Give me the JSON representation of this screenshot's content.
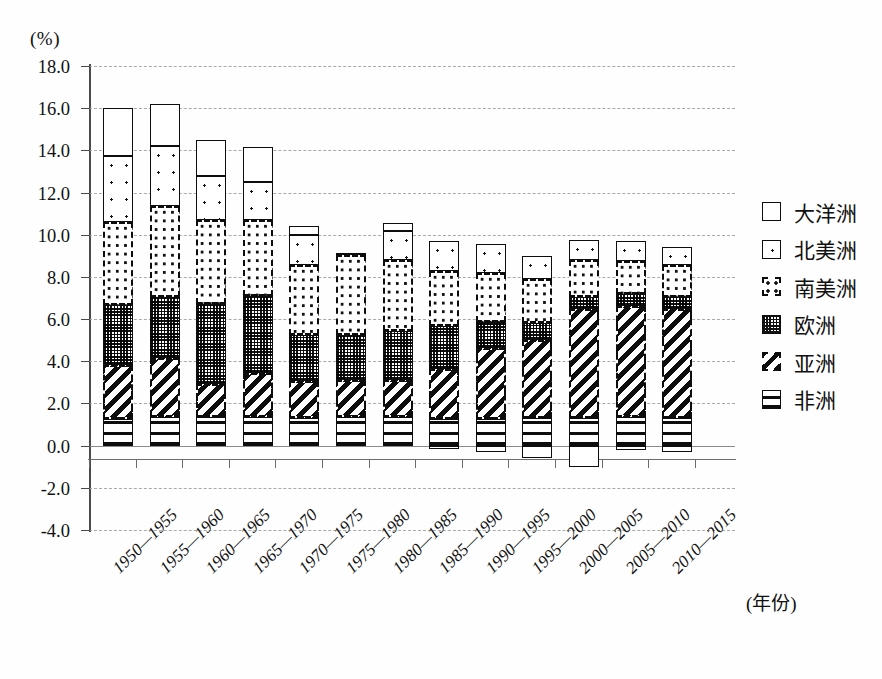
{
  "chart_data": {
    "type": "bar",
    "subtype": "stacked-bar",
    "title": "",
    "unit_label": "(%)",
    "xlabel": "(年份)",
    "ylabel": "",
    "ylim": [
      -4.0,
      18.0
    ],
    "ytick_step": 2.0,
    "ytick_labels": [
      "18.0",
      "16.0",
      "14.0",
      "12.0",
      "10.0",
      "8.0",
      "6.0",
      "4.0",
      "2.0",
      "0.0",
      "-2.0",
      "-4.0"
    ],
    "ytick_values": [
      18.0,
      16.0,
      14.0,
      12.0,
      10.0,
      8.0,
      6.0,
      4.0,
      2.0,
      0.0,
      -2.0,
      -4.0
    ],
    "grid": true,
    "legend_position": "right",
    "categories": [
      "1950—1955",
      "1955—1960",
      "1960—1965",
      "1965—1970",
      "1970—1975",
      "1975—1980",
      "1980—1985",
      "1985—1990",
      "1990—1995",
      "1995—2000",
      "2000—2005",
      "2005—2010",
      "2010—2015"
    ],
    "series": [
      {
        "name": "非洲",
        "key": "africa",
        "swatch": "horizontal-lines",
        "values": [
          1.25,
          1.35,
          1.35,
          1.35,
          1.3,
          1.35,
          1.35,
          1.25,
          1.25,
          1.3,
          1.3,
          1.35,
          1.3
        ]
      },
      {
        "name": "亚洲",
        "key": "asia",
        "swatch": "diagonal-stripes",
        "values": [
          2.55,
          2.8,
          1.55,
          2.1,
          1.75,
          1.75,
          1.75,
          2.4,
          3.4,
          3.7,
          5.2,
          5.25,
          5.2
        ]
      },
      {
        "name": "欧洲",
        "key": "europe",
        "swatch": "checkerboard",
        "values": [
          2.85,
          2.9,
          3.8,
          3.65,
          2.2,
          2.15,
          2.35,
          2.0,
          1.2,
          0.8,
          0.55,
          0.6,
          0.55
        ]
      },
      {
        "name": "南美洲",
        "key": "samerica",
        "swatch": "dense-dots",
        "values": [
          3.95,
          4.3,
          4.0,
          3.6,
          3.3,
          3.8,
          3.35,
          2.65,
          2.35,
          2.1,
          1.75,
          1.55,
          1.5
        ]
      },
      {
        "name": "北美洲",
        "key": "namerica",
        "swatch": "sparse-dot",
        "values": [
          3.15,
          2.85,
          2.1,
          1.8,
          1.45,
          0.0,
          1.4,
          1.4,
          1.35,
          1.1,
          0.95,
          0.95,
          0.85
        ]
      },
      {
        "name": "大洋洲",
        "key": "oceania",
        "swatch": "plain-white",
        "values": [
          2.25,
          2.0,
          1.7,
          1.65,
          0.4,
          0.1,
          0.35,
          -0.15,
          -0.3,
          -0.6,
          -1.0,
          -0.2,
          -0.3
        ]
      }
    ],
    "stack_tops": [
      16.0,
      16.2,
      14.5,
      12.9,
      10.4,
      10.1,
      10.2,
      9.8,
      9.55,
      9.0,
      9.0,
      9.25,
      8.85
    ]
  },
  "legend": {
    "items": [
      {
        "label": "大洋洲"
      },
      {
        "label": "北美洲"
      },
      {
        "label": "南美洲"
      },
      {
        "label": "欧洲"
      },
      {
        "label": "亚洲"
      },
      {
        "label": "非洲"
      }
    ]
  }
}
